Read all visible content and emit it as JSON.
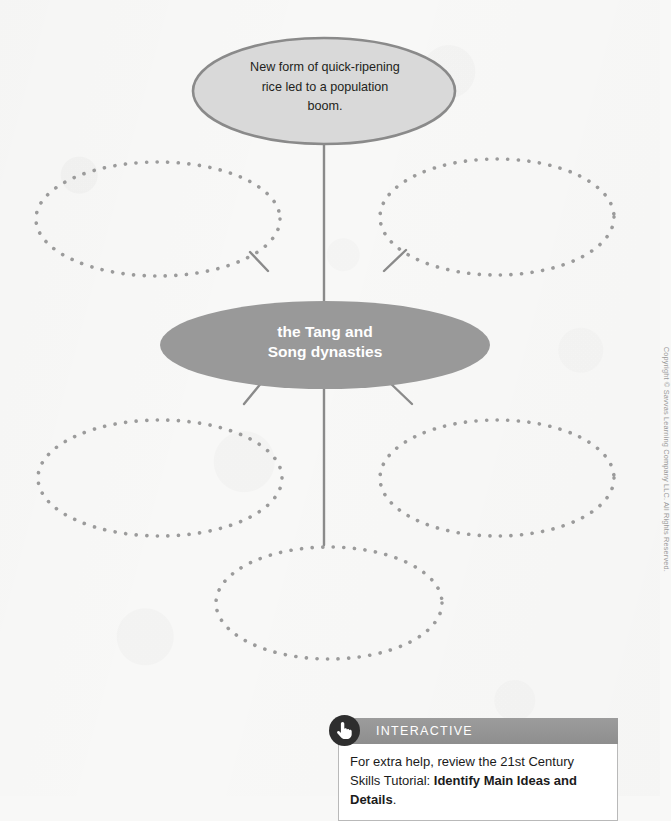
{
  "page": {
    "background_color": "#f8f8f7",
    "copyright": "Copyright © Savvas Learning Company LLC. All Rights Reserved."
  },
  "diagram": {
    "type": "concept-web",
    "center_node": {
      "label": "the Tang and\nSong dynasties",
      "line1": "the Tang and",
      "line2": "Song dynasties",
      "fill_color": "#999999",
      "text_color": "#ffffff",
      "style": "solid"
    },
    "filled_nodes": [
      {
        "id": "top-node",
        "text": "New form of quick-ripening rice led to a population boom.",
        "line1": "New form of quick-ripening",
        "line2": "rice led to a population",
        "line3": "boom.",
        "fill_color": "#d9d9d9",
        "border_color": "#8a8a8a",
        "text_color": "#231f20",
        "style": "solid"
      }
    ],
    "empty_nodes": [
      {
        "id": "empty-node-upper-left",
        "text": "",
        "style": "dotted",
        "dot_color": "#9b9b9b"
      },
      {
        "id": "empty-node-upper-right",
        "text": "",
        "style": "dotted",
        "dot_color": "#9b9b9b"
      },
      {
        "id": "empty-node-lower-left",
        "text": "",
        "style": "dotted",
        "dot_color": "#9b9b9b"
      },
      {
        "id": "empty-node-lower-right",
        "text": "",
        "style": "dotted",
        "dot_color": "#9b9b9b"
      },
      {
        "id": "empty-node-bottom",
        "text": "",
        "style": "dotted",
        "dot_color": "#9b9b9b"
      }
    ],
    "connector_color": "#8a8a8a",
    "connector_count": 6
  },
  "interactive_callout": {
    "icon": "pointing-hand-icon",
    "header_label": "INTERACTIVE",
    "header_color": "#8e8e8e",
    "badge_color": "#2e2e2e",
    "body_text_plain": "For extra help, review the 21st Century Skills Tutorial: Identify Main Ideas and Details.",
    "body_prefix": "For extra help, review the 21st Century Skills Tutorial: ",
    "body_emphasis": "Identify Main Ideas and Details",
    "body_suffix": "."
  }
}
